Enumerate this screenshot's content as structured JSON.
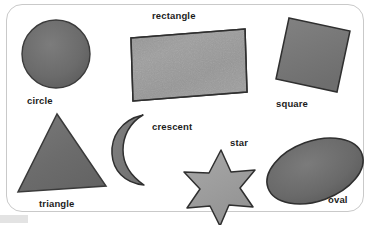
{
  "poster": {
    "title": "Shapes learning poster",
    "background_color": "#ffffff",
    "card_border_color": "#c9c9c9",
    "label_color": "#1c1c1c"
  },
  "shapes": [
    {
      "id": "circle",
      "label": "circle",
      "icon": "circle-shape-icon",
      "fill": "#6b6b6b",
      "stroke": "#3b3b3b",
      "rotation_deg": 0
    },
    {
      "id": "rectangle",
      "label": "rectangle",
      "icon": "rectangle-shape-icon",
      "fill": "#a3a3a3",
      "stroke": "#2f2f2f",
      "rotation_deg": -3
    },
    {
      "id": "square",
      "label": "square",
      "icon": "square-shape-icon",
      "fill": "#7a7a7a",
      "stroke": "#2f2f2f",
      "rotation_deg": -12
    },
    {
      "id": "triangle",
      "label": "triangle",
      "icon": "triangle-shape-icon",
      "fill": "#6e6e6e",
      "stroke": "#3a3a3a",
      "rotation_deg": 0
    },
    {
      "id": "crescent",
      "label": "crescent",
      "icon": "crescent-shape-icon",
      "fill": "#787878",
      "stroke": "#2f2f2f",
      "rotation_deg": 0
    },
    {
      "id": "star",
      "label": "star",
      "icon": "star-shape-icon",
      "fill": "#9e9e9e",
      "stroke": "#2f2f2f",
      "points": 6,
      "rotation_deg": 0
    },
    {
      "id": "oval",
      "label": "oval",
      "icon": "oval-shape-icon",
      "fill": "#6a6a6a",
      "stroke": "#2f2f2f",
      "rotation_deg": -22
    }
  ]
}
